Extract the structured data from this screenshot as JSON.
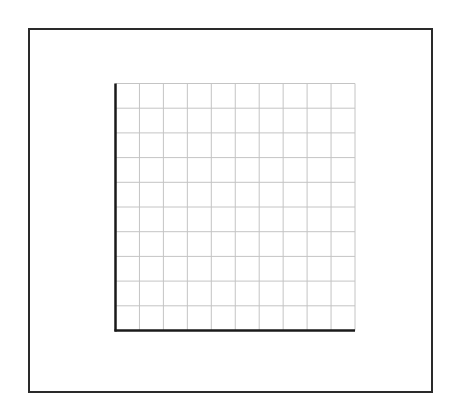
{
  "diagram": {
    "type": "blank-grid",
    "outer_frame": {
      "color": "#2a2a2a"
    },
    "grid": {
      "columns": 10,
      "rows": 10,
      "line_color": "#c4c4c4",
      "axis_color": "#1a1a1a"
    }
  }
}
